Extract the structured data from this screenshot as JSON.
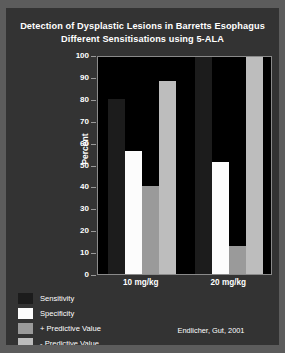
{
  "slide": {
    "title_line1": "Detection of Dysplastic Lesions in Barretts Esophagus",
    "title_line2": "Different Sensitisations using 5-ALA",
    "citation": "Endlicher, Gut, 2001"
  },
  "colors": {
    "slide_background": "#333333",
    "slide_frame": "#5c5c5c",
    "plot_background": "#000000",
    "axis": "#8a8a8a",
    "text": "#ffffff",
    "sensitivity": "#1c1c1c",
    "specificity": "#fcfcfc",
    "pos_predictive_value": "#9a9a9a",
    "neg_predictive_value": "#bdbdbd"
  },
  "chart_data": {
    "type": "bar",
    "title": "Detection of Dysplastic Lesions in Barretts Esophagus Different Sensitisations using 5-ALA",
    "xlabel": "",
    "ylabel": "Percent",
    "ylim": [
      0,
      100
    ],
    "yticks": [
      0,
      10,
      20,
      30,
      40,
      50,
      60,
      70,
      80,
      90,
      100
    ],
    "ytick_labels": [
      "0",
      "10",
      "20",
      "30",
      "40",
      "50",
      "60",
      "70",
      "80",
      "90",
      "100"
    ],
    "categories": [
      "10 mg/kg",
      "20 mg/kg"
    ],
    "grid": false,
    "legend_position": "bottom-left",
    "series": [
      {
        "name": "Sensitivity",
        "color": "#1c1c1c",
        "values": [
          80,
          100
        ]
      },
      {
        "name": "Specificity",
        "color": "#fcfcfc",
        "values": [
          56,
          51
        ]
      },
      {
        "name": "+ Predictive Value",
        "color": "#9a9a9a",
        "values": [
          40,
          13
        ]
      },
      {
        "name": "- Predictive Value",
        "color": "#bdbdbd",
        "values": [
          88,
          100
        ]
      }
    ]
  }
}
